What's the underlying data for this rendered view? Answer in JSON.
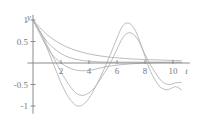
{
  "chart_data": {
    "type": "line",
    "title": "",
    "xlabel": "t",
    "ylabel": "y",
    "xlim": [
      -0.4,
      11.2
    ],
    "ylim": [
      -1.18,
      1.12
    ],
    "grid": false,
    "legend": null,
    "xticks": [
      2,
      4,
      6,
      8,
      10
    ],
    "xtick_labels": [
      "2",
      "4",
      "6",
      "8",
      "10"
    ],
    "yticks": [
      1,
      0.5,
      -0.5,
      -1
    ],
    "ytick_labels": [
      "1",
      "0.5",
      "-0.5",
      "-1"
    ],
    "axis_color": "#8c8c8c",
    "curve_color": "#b0b0b0",
    "background": "#ffffff",
    "series": [
      {
        "name": "curve-1-underdamped-strong",
        "color": "#b0b0b0",
        "x": [
          0,
          0.5,
          1,
          1.5,
          1.8,
          2,
          2.5,
          3,
          3.3,
          3.6,
          4,
          4.5,
          5,
          5.5,
          6,
          6.4,
          6.8,
          7.2,
          7.6,
          8,
          8.4,
          9,
          9.5,
          9.8,
          10.2,
          10.6
        ],
        "y": [
          1,
          0.72,
          0.35,
          -0.06,
          -0.3,
          -0.46,
          -0.78,
          -0.97,
          -1.0,
          -0.96,
          -0.82,
          -0.53,
          -0.2,
          0.18,
          0.58,
          0.86,
          0.93,
          0.82,
          0.53,
          0.15,
          -0.2,
          -0.53,
          -0.62,
          -0.6,
          -0.55,
          -0.62
        ]
      },
      {
        "name": "curve-2-underdamped-moderate",
        "color": "#b0b0b0",
        "x": [
          0,
          0.5,
          1,
          1.5,
          2,
          2.2,
          2.6,
          3,
          3.4,
          3.8,
          4.2,
          4.6,
          5,
          5.5,
          6,
          6.4,
          6.8,
          7.2,
          7.6,
          8,
          8.4,
          9,
          9.4,
          9.8,
          10.2,
          10.6
        ],
        "y": [
          1,
          0.74,
          0.42,
          0.1,
          -0.2,
          -0.32,
          -0.52,
          -0.68,
          -0.75,
          -0.73,
          -0.64,
          -0.48,
          -0.28,
          -0.02,
          0.32,
          0.58,
          0.7,
          0.66,
          0.48,
          0.2,
          -0.05,
          -0.35,
          -0.47,
          -0.5,
          -0.46,
          -0.45
        ]
      },
      {
        "name": "curve-3-critically-damped",
        "color": "#b0b0b0",
        "x": [
          0,
          0.5,
          1,
          1.5,
          2,
          2.5,
          3,
          3.5,
          4,
          4.5,
          5,
          5.5,
          6,
          7,
          8,
          9,
          10,
          10.6
        ],
        "y": [
          1,
          0.67,
          0.37,
          0.15,
          0.0,
          -0.1,
          -0.16,
          -0.18,
          -0.17,
          -0.14,
          -0.1,
          -0.07,
          -0.05,
          -0.02,
          0.0,
          0.01,
          0.01,
          0.01
        ]
      },
      {
        "name": "curve-4-overdamped",
        "color": "#b0b0b0",
        "x": [
          0,
          0.5,
          1,
          1.5,
          2,
          2.5,
          3,
          3.5,
          4,
          4.5,
          5,
          5.5,
          6,
          7,
          8,
          9,
          10,
          10.6
        ],
        "y": [
          1,
          0.73,
          0.5,
          0.34,
          0.22,
          0.14,
          0.09,
          0.06,
          0.04,
          0.03,
          0.02,
          0.02,
          0.02,
          0.02,
          0.02,
          0.02,
          0.02,
          0.02
        ]
      },
      {
        "name": "curve-5-overdamped-strong",
        "color": "#b0b0b0",
        "x": [
          0,
          0.5,
          1,
          1.5,
          2,
          2.5,
          3,
          3.5,
          4,
          4.5,
          5,
          5.5,
          6,
          7,
          8,
          9,
          10,
          10.6
        ],
        "y": [
          1,
          0.82,
          0.66,
          0.54,
          0.44,
          0.36,
          0.3,
          0.25,
          0.21,
          0.18,
          0.155,
          0.135,
          0.12,
          0.095,
          0.08,
          0.07,
          0.06,
          0.055
        ]
      }
    ]
  }
}
